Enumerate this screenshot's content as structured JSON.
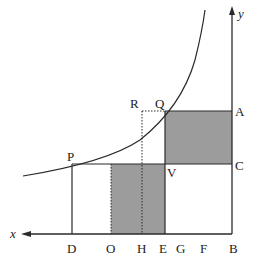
{
  "diagram": {
    "type": "economics-graph",
    "colors": {
      "line": "#2a2a2a",
      "shade": "#9c9c9c",
      "background": "#ffffff"
    },
    "axes": {
      "x_label": "x",
      "y_label": "y",
      "x_direction": "leftward",
      "origin_label": "B"
    },
    "axis_labels": {
      "D": "D",
      "O": "O",
      "H": "H",
      "E": "E",
      "G": "G",
      "F": "F",
      "B": "B",
      "A": "A",
      "C": "C"
    },
    "point_labels": {
      "P": "P",
      "Q": "Q",
      "R": "R",
      "V": "V"
    },
    "shaded_regions": [
      {
        "name": "rectangle-Q-A-C-V",
        "corners": [
          "Q",
          "A",
          "C",
          "V"
        ]
      },
      {
        "name": "rectangle-O-E-V",
        "corners": [
          "O",
          "E",
          "V"
        ]
      }
    ],
    "dotted_lines": [
      {
        "name": "R-to-Q",
        "from": "R",
        "to": "Q"
      },
      {
        "name": "R-to-H",
        "from": "R",
        "to": "H"
      },
      {
        "name": "O-vertical",
        "from": "O",
        "to": "P-C line"
      }
    ]
  }
}
